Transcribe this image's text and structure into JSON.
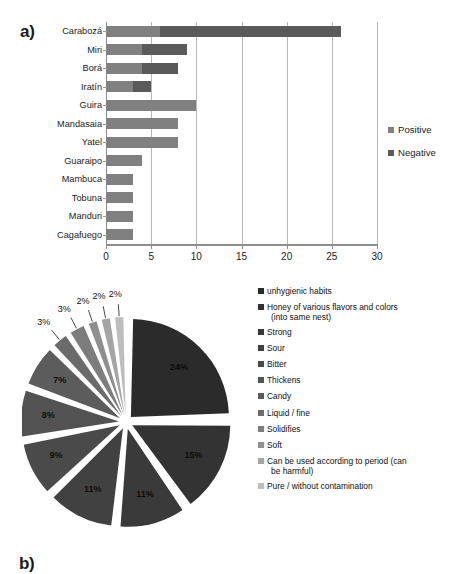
{
  "figure": {
    "panel_a_tag": "a)",
    "panel_b_tag": "b)"
  },
  "chart_data": [
    {
      "type": "bar",
      "orientation": "horizontal",
      "stacked": true,
      "title": "",
      "xlabel": "",
      "ylabel": "",
      "xlim": [
        0,
        30
      ],
      "xticks": [
        0,
        5,
        10,
        15,
        20,
        25,
        30
      ],
      "grid": true,
      "legend_position": "right",
      "categories": [
        "Carabozá",
        "Miri",
        "Borá",
        "Iratín",
        "Guira",
        "Mandasaia",
        "Yatel",
        "Guaraipo",
        "Mambuca",
        "Tobuna",
        "Manduri",
        "Cagafuego"
      ],
      "series": [
        {
          "name": "Positive",
          "color": "#808080",
          "values": [
            6,
            4,
            4,
            3,
            10,
            8,
            8,
            4,
            3,
            3,
            3,
            3
          ]
        },
        {
          "name": "Negative",
          "color": "#5a5a5a",
          "values": [
            20,
            5,
            4,
            2,
            0,
            0,
            0,
            0,
            0,
            0,
            0,
            0
          ]
        }
      ],
      "totals": [
        26,
        9,
        8,
        5,
        10,
        8,
        8,
        4,
        3,
        3,
        3,
        3
      ]
    },
    {
      "type": "pie",
      "title": "",
      "exploded": true,
      "legend_position": "right",
      "labels": [
        "unhygienic habits",
        "Honey of various flavors and colors (into same nest)",
        "Strong",
        "Sour",
        "Bitter",
        "Thickens",
        "Candy",
        "Liquid / fine",
        "Solidifies",
        "Soft",
        "Can be used according to period (can be harmful)",
        "Pure / without contamination"
      ],
      "values": [
        24,
        15,
        11,
        11,
        9,
        8,
        7,
        3,
        3,
        2,
        2,
        2
      ],
      "value_labels": [
        "24%",
        "15%",
        "11%",
        "11%",
        "9%",
        "8%",
        "7%",
        "3%",
        "3%",
        "2%",
        "2%",
        "2%"
      ],
      "extra_callouts": [
        "2%",
        "2%"
      ],
      "colors": [
        "#2b2b2b",
        "#333333",
        "#3a3a3a",
        "#414141",
        "#4a4a4a",
        "#525252",
        "#5c5c5c",
        "#6b6b6b",
        "#7d7d7d",
        "#8f8f8f",
        "#a4a4a4",
        "#bdbdbd"
      ]
    }
  ],
  "bar_chart": {
    "legend": [
      {
        "label": "Positive",
        "color": "#808080"
      },
      {
        "label": "Negative",
        "color": "#5a5a5a"
      }
    ],
    "x_tick_labels": [
      "0",
      "5",
      "10",
      "15",
      "20",
      "25",
      "30"
    ],
    "categories": [
      "Carabozá",
      "Miri",
      "Borá",
      "Iratín",
      "Guira",
      "Mandasaia",
      "Yatel",
      "Guaraipo",
      "Mambuca",
      "Tobuna",
      "Manduri",
      "Cagafuego"
    ]
  },
  "pie_chart": {
    "legend": [
      {
        "label": "unhygienic habits",
        "cont": "",
        "color": "#2b2b2b"
      },
      {
        "label": "Honey of various flavors and colors",
        "cont": "(into same nest)",
        "color": "#333333"
      },
      {
        "label": "Strong",
        "cont": "",
        "color": "#3a3a3a"
      },
      {
        "label": "Sour",
        "cont": "",
        "color": "#414141"
      },
      {
        "label": "Bitter",
        "cont": "",
        "color": "#4a4a4a"
      },
      {
        "label": "Thickens",
        "cont": "",
        "color": "#525252"
      },
      {
        "label": "Candy",
        "cont": "",
        "color": "#5c5c5c"
      },
      {
        "label": "Liquid / fine",
        "cont": "",
        "color": "#6b6b6b"
      },
      {
        "label": "Solidifies",
        "cont": "",
        "color": "#7d7d7d"
      },
      {
        "label": "Soft",
        "cont": "",
        "color": "#8f8f8f"
      },
      {
        "label": "Can be used according to period (can",
        "cont": "be harmful)",
        "color": "#a4a4a4"
      },
      {
        "label": "Pure / without contamination",
        "cont": "",
        "color": "#bdbdbd"
      }
    ],
    "inner_labels": [
      "24%",
      "15%",
      "11%",
      "11%",
      "9%",
      "8%",
      "7%"
    ],
    "outer_labels": [
      "3%",
      "3%",
      "2%",
      "2%",
      "2%",
      "2%",
      "2%"
    ]
  }
}
